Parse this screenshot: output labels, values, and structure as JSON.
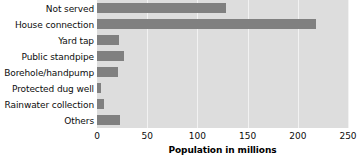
{
  "chart_data": {
    "type": "bar",
    "orientation": "horizontal",
    "title": "",
    "xlabel": "Population in millions",
    "ylabel": "",
    "categories": [
      "Not served",
      "House connection",
      "Yard tap",
      "Public standpipe",
      "Borehole/handpump",
      "Protected dug well",
      "Rainwater collection",
      "Others"
    ],
    "values": [
      128,
      218,
      22,
      27,
      21,
      4,
      7,
      23
    ],
    "xlim": [
      0,
      250
    ],
    "xticks": [
      0,
      50,
      100,
      150,
      200,
      250
    ],
    "xtick_labels": [
      "0",
      "50",
      "100",
      "150",
      "200",
      "250"
    ],
    "grid": true,
    "legend": "none",
    "colors": {
      "bar": "#808080",
      "plot_background": "#dddddd",
      "gridline": "#f2f2f2",
      "page_background": "#ffffff",
      "text": "#0d0d0d"
    }
  }
}
